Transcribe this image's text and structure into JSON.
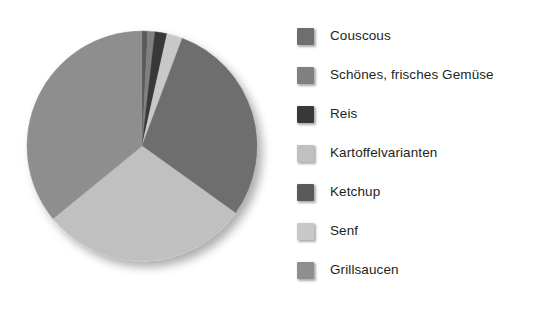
{
  "chart_data": {
    "type": "pie",
    "title": "",
    "legend_position": "right",
    "grid": false,
    "categories": [
      "Couscous",
      "Schönes, frisches Gemüse",
      "Reis",
      "Kartoffelvarianten",
      "Ketchup",
      "Senf",
      "Grillsaucen"
    ],
    "values": [
      29.2,
      1.0,
      1.7,
      29.2,
      0.8,
      2.2,
      35.9
    ],
    "colors": [
      "#6e6e6e",
      "#808080",
      "#383838",
      "#c0c0c0",
      "#5a5a5a",
      "#c8c8c8",
      "#8e8e8e"
    ],
    "slice_order_clockwise_from_12": [
      "Ketchup",
      "Schönes, frisches Gemüse",
      "Reis",
      "Senf",
      "Couscous",
      "Kartoffelvarianten",
      "Grillsaucen"
    ],
    "xlabel": "",
    "ylabel": ""
  },
  "legend": {
    "items": [
      {
        "label": "Couscous",
        "color": "#6e6e6e",
        "swatch_name": "legend-swatch-couscous"
      },
      {
        "label": "Schönes, frisches Gemüse",
        "color": "#808080",
        "swatch_name": "legend-swatch-schoenes-frisches-gemuese"
      },
      {
        "label": "Reis",
        "color": "#383838",
        "swatch_name": "legend-swatch-reis"
      },
      {
        "label": "Kartoffelvarianten",
        "color": "#c0c0c0",
        "swatch_name": "legend-swatch-kartoffelvarianten"
      },
      {
        "label": "Ketchup",
        "color": "#5a5a5a",
        "swatch_name": "legend-swatch-ketchup"
      },
      {
        "label": "Senf",
        "color": "#c8c8c8",
        "swatch_name": "legend-swatch-senf"
      },
      {
        "label": "Grillsaucen",
        "color": "#8e8e8e",
        "swatch_name": "legend-swatch-grillsaucen"
      }
    ]
  }
}
